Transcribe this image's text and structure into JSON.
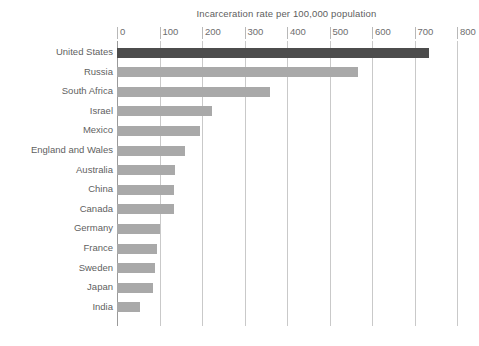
{
  "chart_data": {
    "type": "bar",
    "orientation": "horizontal",
    "title": "Incarceration rate per 100,000 population",
    "xlabel": "",
    "ylabel": "",
    "xlim": [
      0,
      800
    ],
    "xticks": [
      0,
      100,
      200,
      300,
      400,
      500,
      600,
      700,
      800
    ],
    "xtick_labels": [
      "0",
      "100",
      "200",
      "300",
      "400",
      "500",
      "600",
      "700",
      "800"
    ],
    "grid": true,
    "legend": false,
    "categories": [
      "United States",
      "Russia",
      "South Africa",
      "Israel",
      "Mexico",
      "England and Wales",
      "Australia",
      "China",
      "Canada",
      "Germany",
      "France",
      "Sweden",
      "Japan",
      "India"
    ],
    "values": [
      735,
      568,
      359,
      223,
      196,
      160,
      137,
      135,
      134,
      101,
      94,
      89,
      85,
      53
    ],
    "highlight_category": "United States",
    "colors": {
      "bar": "#a9a9a9",
      "bar_highlight": "#4c4c4c",
      "gridline": "#c9c9c9",
      "axis": "#9a9a9a",
      "text": "#5f5f5f",
      "background": "#ffffff"
    }
  }
}
